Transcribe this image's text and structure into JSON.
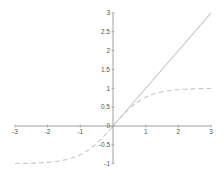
{
  "chart_data": {
    "type": "line",
    "title": "",
    "xlabel": "",
    "ylabel": "",
    "xlim": [
      -3,
      3
    ],
    "ylim": [
      -1,
      3
    ],
    "grid": false,
    "legend": null,
    "x_ticks": [
      "-3",
      "-2",
      "-1",
      "0",
      "1",
      "2",
      "3"
    ],
    "y_ticks": [
      "-1",
      "-0.5",
      "0",
      "0.5",
      "1",
      "1.5",
      "2",
      "2.5",
      "3"
    ],
    "series": [
      {
        "name": "y = x",
        "style": "solid",
        "color": "#c8c8c8",
        "x": [
          0,
          3
        ],
        "y": [
          0,
          3
        ]
      },
      {
        "name": "y = tanh(x)",
        "style": "dashed",
        "color": "#c8c8c8",
        "x": [
          -3,
          -2.5,
          -2,
          -1.5,
          -1,
          -0.5,
          0,
          0.5,
          1,
          1.5,
          2,
          2.5,
          3
        ],
        "y": [
          -0.995,
          -0.987,
          -0.964,
          -0.905,
          -0.762,
          -0.462,
          0,
          0.462,
          0.762,
          0.905,
          0.964,
          0.987,
          0.995
        ]
      }
    ],
    "colors": {
      "axis": "#888888",
      "line": "#c8c8c8"
    }
  }
}
